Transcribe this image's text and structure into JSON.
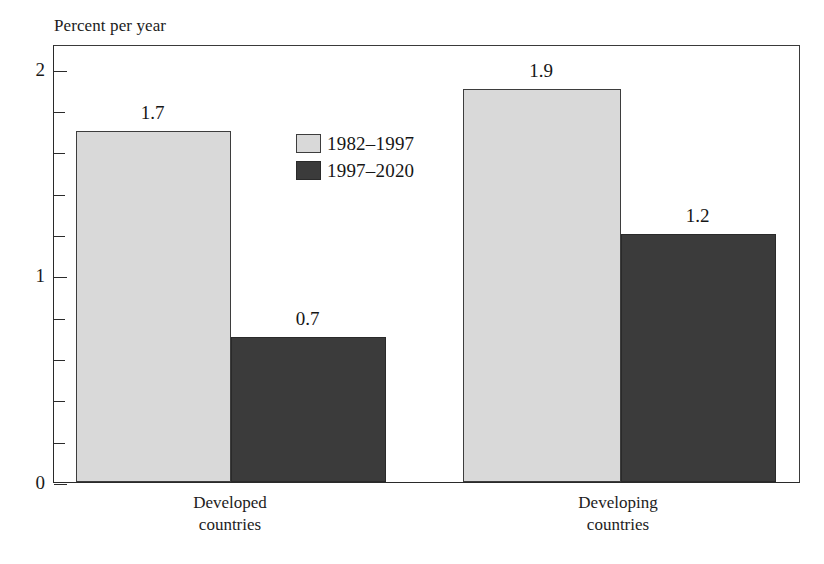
{
  "chart_data": {
    "type": "bar",
    "title": "",
    "subtitle": "",
    "xlabel": "",
    "ylabel": "Percent per year",
    "categories": [
      "Developed\ncountries",
      "Developing\ncountries"
    ],
    "category_lines": [
      [
        "Developed",
        "countries"
      ],
      [
        "Developing",
        "countries"
      ]
    ],
    "series": [
      {
        "name": "1982–1997",
        "values": [
          1.7,
          1.9
        ],
        "color": "#d9d9d9"
      },
      {
        "name": "1997–2020",
        "values": [
          0.7,
          1.2
        ],
        "color": "#3b3b3b"
      }
    ],
    "data_labels": [
      [
        "1.7",
        "1.9"
      ],
      [
        "0.7",
        "1.2"
      ]
    ],
    "ylim": [
      0,
      2.12
    ],
    "ytick_values": [
      0,
      1,
      2
    ],
    "ytick_labels": [
      "0",
      "1",
      "2"
    ],
    "yminor_step": 0.2,
    "grid": false,
    "legend_position": "inside-upper-center-left",
    "frame": "box"
  },
  "axis": {
    "y_title": "Percent per year",
    "ticks": [
      {
        "value": 2,
        "label": "2",
        "major": true
      },
      {
        "value": 1.8,
        "label": "",
        "major": false
      },
      {
        "value": 1.6,
        "label": "",
        "major": false
      },
      {
        "value": 1.4,
        "label": "",
        "major": false
      },
      {
        "value": 1.2,
        "label": "",
        "major": false
      },
      {
        "value": 1.0,
        "label": "1",
        "major": true
      },
      {
        "value": 0.8,
        "label": "",
        "major": false
      },
      {
        "value": 0.6,
        "label": "",
        "major": false
      },
      {
        "value": 0.4,
        "label": "",
        "major": false
      },
      {
        "value": 0.2,
        "label": "",
        "major": false
      },
      {
        "value": 0,
        "label": "0",
        "major": true
      }
    ]
  },
  "legend": {
    "items": [
      {
        "label": "1982–1997",
        "swatch": "light"
      },
      {
        "label": "1997–2020",
        "swatch": "dark"
      }
    ]
  },
  "colors": {
    "series_light": "#d9d9d9",
    "series_dark": "#3b3b3b",
    "axis": "#2a2a2a",
    "text": "#1a1a1a",
    "background": "#ffffff"
  }
}
